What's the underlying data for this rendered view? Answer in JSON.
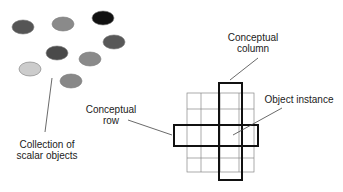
{
  "diagram": {
    "scalar_collection": {
      "label_line1": "Collection of",
      "label_line2": "scalar objects",
      "dots": [
        {
          "cx": 23,
          "cy": 27,
          "fill": "#555555"
        },
        {
          "cx": 63,
          "cy": 24,
          "fill": "#8a8a8a"
        },
        {
          "cx": 103,
          "cy": 18,
          "fill": "#111111"
        },
        {
          "cx": 114,
          "cy": 42,
          "fill": "#585858"
        },
        {
          "cx": 57,
          "cy": 53,
          "fill": "#4a4a4a"
        },
        {
          "cx": 90,
          "cy": 59,
          "fill": "#8a8a8a"
        },
        {
          "cx": 30,
          "cy": 69,
          "fill": "#cccccc"
        },
        {
          "cx": 71,
          "cy": 81,
          "fill": "#888888"
        }
      ]
    },
    "table": {
      "column_label_line1": "Conceptual",
      "column_label_line2": "column",
      "row_label_line1": "Conceptual",
      "row_label_line2": "row",
      "instance_label": "Object instance"
    }
  }
}
